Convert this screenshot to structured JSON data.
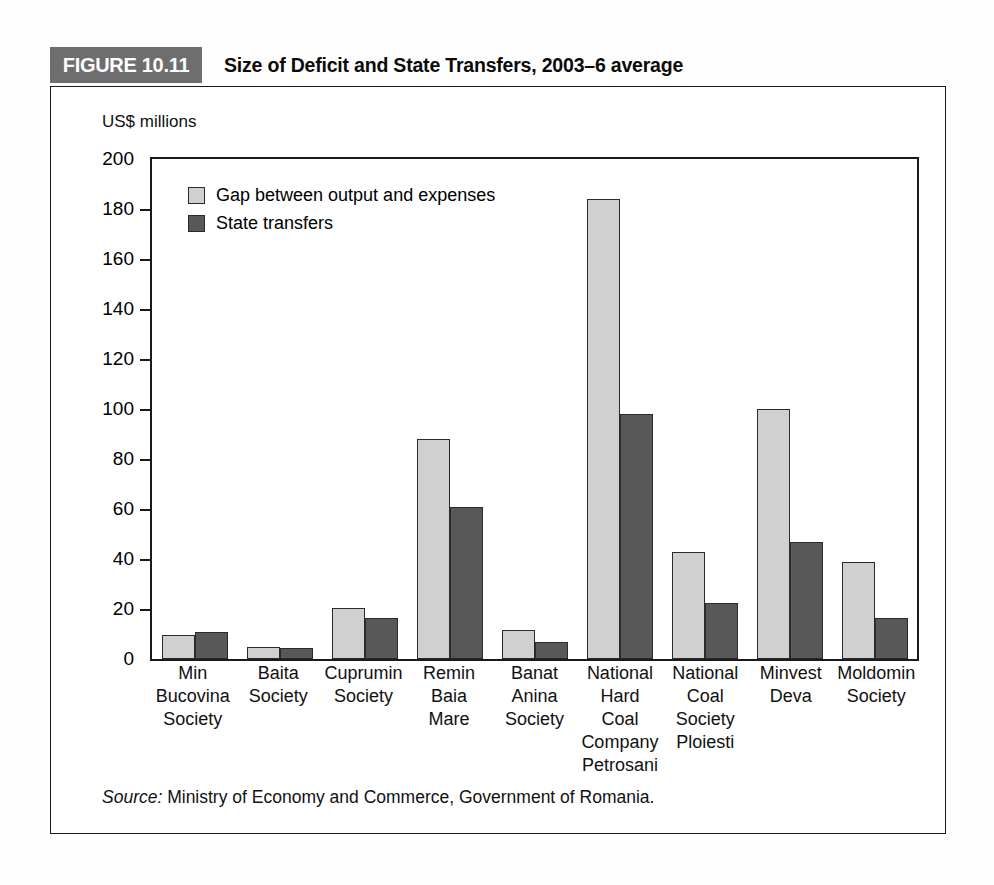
{
  "figure": {
    "tag": "FIGURE 10.11",
    "title": "Size of Deficit and State Transfers, 2003–6 average",
    "source_prefix": "Source:",
    "source_text": " Ministry of Economy and Commerce, Government of Romania."
  },
  "colors": {
    "light_series": "#d0d0d0",
    "dark_series": "#585858",
    "tag_background": "#6e6e6e",
    "frame": "#1a1a1a"
  },
  "chart_data": {
    "type": "bar",
    "title": "Size of Deficit and State Transfers, 2003–6 average",
    "xlabel": "",
    "ylabel": "US$ millions",
    "ylim": [
      0,
      200
    ],
    "yticks": [
      0,
      20,
      40,
      60,
      80,
      100,
      120,
      140,
      160,
      180,
      200
    ],
    "ytick_labels": [
      "0",
      "20",
      "40",
      "60",
      "80",
      "100",
      "120",
      "140",
      "160",
      "180",
      "200"
    ],
    "grid": false,
    "legend_position": "top-left",
    "categories": [
      "Min Bucovina Society",
      "Baita Society",
      "Cuprumin Society",
      "Remin Baia Mare",
      "Banat Anina Society",
      "National Hard Coal Company Petrosani",
      "National Coal Society Ploiesti",
      "Minvest Deva",
      "Moldomin Society"
    ],
    "category_lines": [
      [
        "Min",
        "Bucovina",
        "Society"
      ],
      [
        "Baita",
        "Society"
      ],
      [
        "Cuprumin",
        "Society"
      ],
      [
        "Remin",
        "Baia",
        "Mare"
      ],
      [
        "Banat",
        "Anina",
        "Society"
      ],
      [
        "National",
        "Hard",
        "Coal",
        "Company",
        "Petrosani"
      ],
      [
        "National",
        "Coal",
        "Society",
        "Ploiesti"
      ],
      [
        "Minvest",
        "Deva"
      ],
      [
        "Moldomin",
        "Society"
      ]
    ],
    "series": [
      {
        "name": "Gap between output and expenses",
        "color": "#d0d0d0",
        "values": [
          9.5,
          5,
          20.5,
          88,
          11.5,
          184,
          43,
          100,
          39
        ]
      },
      {
        "name": "State transfers",
        "color": "#585858",
        "values": [
          11,
          4.5,
          16.5,
          61,
          7,
          98,
          22.5,
          47,
          16.5
        ]
      }
    ]
  }
}
